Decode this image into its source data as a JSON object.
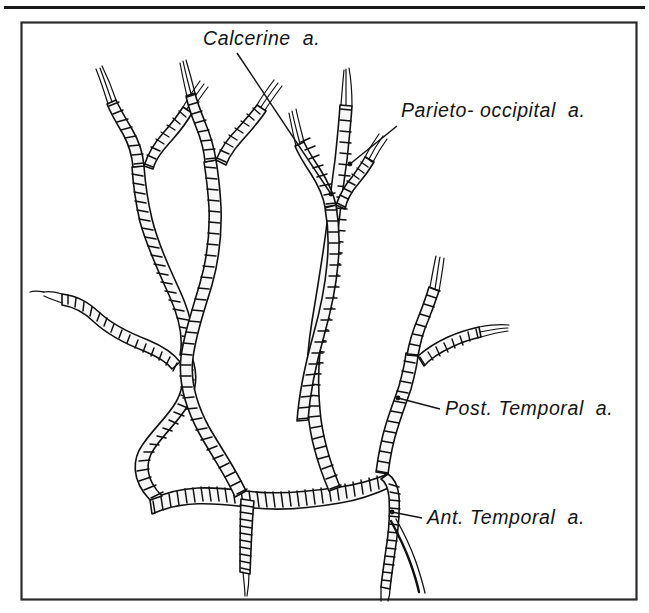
{
  "figure": {
    "kind": "anatomical-line-illustration",
    "width": 649,
    "height": 613,
    "background_color": "#ffffff",
    "ink_color": "#111111",
    "frame": {
      "top_rule_present": true,
      "box_present": true,
      "box_x": 21,
      "box_y": 22,
      "box_width": 616,
      "box_height": 578
    }
  },
  "labels": [
    {
      "id": "calcarine",
      "text": "Calcerine  a.",
      "x": 203,
      "y": 45,
      "anchor": "start",
      "leader": {
        "x1": 237,
        "y1": 53,
        "x2": 331,
        "y2": 194
      }
    },
    {
      "id": "parieto-occipital",
      "text": "Parieto- occipital  a.",
      "x": 401,
      "y": 117,
      "anchor": "start",
      "leader": {
        "x1": 397,
        "y1": 126,
        "x2": 350,
        "y2": 164
      }
    },
    {
      "id": "post-temporal",
      "text": "Post. Temporal  a.",
      "x": 445,
      "y": 415,
      "anchor": "start",
      "leader": {
        "x1": 440,
        "y1": 409,
        "x2": 398,
        "y2": 398
      }
    },
    {
      "id": "ant-temporal",
      "text": "Ant. Temporal  a.",
      "x": 427,
      "y": 524,
      "anchor": "start",
      "leader": {
        "x1": 422,
        "y1": 518,
        "x2": 392,
        "y2": 512
      }
    }
  ],
  "vessels": {
    "trunk_label": "main arterial trunk",
    "branch_count": 4,
    "descending_stub_label": "central descending branch",
    "named_branches": [
      "Calcerine a.",
      "Parieto- occipital a.",
      "Post. Temporal a.",
      "Ant. Temporal a."
    ]
  }
}
